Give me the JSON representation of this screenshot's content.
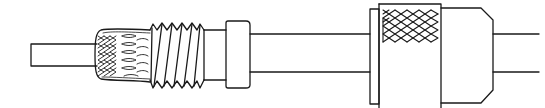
{
  "figure": {
    "title": "Coaxial cable connector assembly (line drawing)",
    "background": "#ffffff",
    "stroke_color": "#1a1a1a",
    "parts": [
      {
        "id": "cable-center-stub",
        "label": "Exposed cable dielectric/conductor"
      },
      {
        "id": "shield-braid",
        "label": "Folded-back shield braid"
      },
      {
        "id": "threaded-ferrule",
        "label": "Threaded ferrule / adapter"
      },
      {
        "id": "ferrule-collar",
        "label": "Collar"
      },
      {
        "id": "cable-jacket",
        "label": "Cable jacket"
      },
      {
        "id": "coupling-ring",
        "label": "Knurled coupling ring"
      },
      {
        "id": "connector-body",
        "label": "Connector body"
      },
      {
        "id": "cable-exit",
        "label": "Cable exit"
      }
    ]
  }
}
